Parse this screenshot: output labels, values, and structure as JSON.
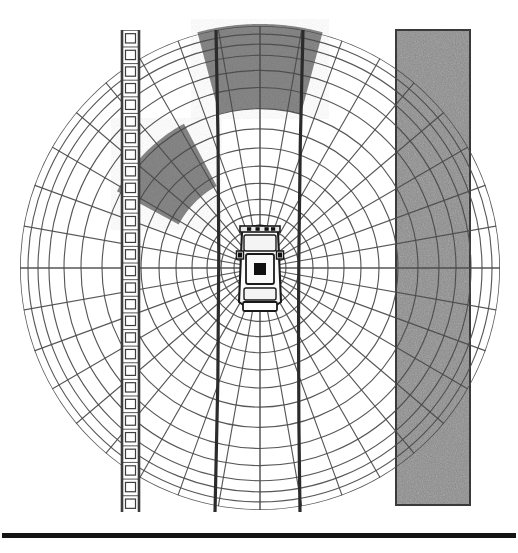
{
  "figure": {
    "title": "Polar occupancy grid around ego vehicle",
    "caption": "",
    "background_color": "#ffffff",
    "width": 518,
    "height": 553
  },
  "colors": {
    "grid_line": "#4a4a4a",
    "grid_line_light": "#6e6e6e",
    "lane_line": "#2b2b2b",
    "occupied_cell": "#7d7d7d",
    "occupied_cell_dark": "#6a6a6a",
    "wall_fill": "#8c8c8c",
    "wall_edge": "#3a3a3a",
    "guardrail_fill": "#ffffff",
    "guardrail_edge": "#3d3d3d",
    "vehicle_body": "#fbfbfb",
    "vehicle_outline": "#1a1a1a",
    "vehicle_detail": "#111111",
    "page_rule": "#141414"
  },
  "ego_vehicle": {
    "label": "ego-vehicle",
    "center_x": 260,
    "center_y": 268,
    "width": 42,
    "length": 92,
    "heading_deg": 0,
    "parts": [
      "roof",
      "windshield",
      "hood",
      "mirrors",
      "rear-window",
      "trunk"
    ]
  },
  "polar_grid": {
    "label": "polar-occupancy-grid",
    "origin_x": 260,
    "origin_y": 268,
    "ring_count": 16,
    "ring_radii": [
      14,
      26,
      39,
      53,
      68,
      84,
      101,
      119,
      138,
      158,
      179,
      196,
      211,
      222,
      232,
      240
    ],
    "ray_count": 36,
    "ray_step_deg": 10,
    "outer_radius": 240,
    "radius_x": 240,
    "radius_y": 242,
    "grid_on": true
  },
  "occupied_sectors": [
    {
      "name": "front-obstacle-sector",
      "start_angle_deg": 75,
      "end_angle_deg": 105,
      "inner_radius": 158,
      "outer_radius": 242,
      "fill": "#7d7d7d"
    },
    {
      "name": "front-left-obstacle-sector",
      "start_angle_deg": 118,
      "end_angle_deg": 152,
      "inner_radius": 92,
      "outer_radius": 162,
      "fill": "#7d7d7d"
    }
  ],
  "lane_lines": [
    {
      "name": "lane-line-left",
      "top_x": 216,
      "bottom_x": 215,
      "mid_x": 222,
      "top_y": 30,
      "bottom_y": 512
    },
    {
      "name": "lane-line-right",
      "top_x": 303,
      "bottom_x": 300,
      "mid_x": 296,
      "top_y": 30,
      "bottom_y": 512
    }
  ],
  "guardrail": {
    "name": "left-guardrail",
    "x": 121,
    "y": 30,
    "width": 19,
    "height": 482,
    "post_count": 29,
    "description": "vertical guardrail barrier with regular posts"
  },
  "wall": {
    "name": "right-wall-barrier",
    "x": 396,
    "y": 30,
    "width": 74,
    "height": 475,
    "texture": "noise",
    "description": "solid textured concrete barrier"
  },
  "page_rule": {
    "name": "page-bottom-rule",
    "x": 2,
    "y": 533,
    "width": 514,
    "height": 5
  }
}
